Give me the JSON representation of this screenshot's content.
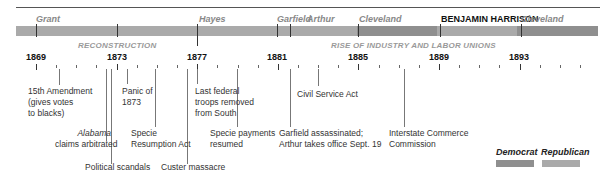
{
  "presidents": [
    {
      "name": "Grant",
      "x": 36,
      "party": "Republican"
    },
    {
      "name": "Hayes",
      "x": 197,
      "party": "Republican"
    },
    {
      "name": "Garfield",
      "x": 277,
      "party": "Republican"
    },
    {
      "name": "Arthur",
      "x": 304,
      "party": "Republican"
    },
    {
      "name": "Cleveland",
      "x": 357,
      "party": "Democrat"
    },
    {
      "name": "BENJAMIN HARRISON",
      "x": 437,
      "party": "Republican"
    },
    {
      "name": "Cleveland",
      "x": 519,
      "party": "Democrat"
    }
  ],
  "eras": [
    {
      "label": "RECONSTRUCTION"
    },
    {
      "label": "RISE OF INDUSTRY AND LABOR UNIONS"
    }
  ],
  "years": [
    "1869",
    "1873",
    "1877",
    "1881",
    "1885",
    "1889",
    "1893"
  ],
  "events": {
    "e1": {
      "line1": "15th Amendment",
      "line2": "(gives votes",
      "line3": "to blacks)"
    },
    "e2": {
      "line1_italic": "Alabama",
      "line2": "claims arbitrated"
    },
    "e3": {
      "line1": "Political scandals"
    },
    "e4": {
      "line1": "Panic of",
      "line2": "1873"
    },
    "e5": {
      "line1": "Specie",
      "line2": "Resumption Act"
    },
    "e6": {
      "line1": "Custer massacre"
    },
    "e7": {
      "line1": "Last federal",
      "line2": "troops removed",
      "line3": "from South"
    },
    "e8": {
      "line1": "Specie payments",
      "line2": "resumed"
    },
    "e9": {
      "line1": "Civil Service Act"
    },
    "e10": {
      "line1": "Garfield assassinated;",
      "line2": "Arthur takes office Sept. 19"
    },
    "e11": {
      "line1": "Interstate Commerce",
      "line2": "Commission"
    }
  },
  "legend": {
    "democrat": {
      "label": "Democrat",
      "color": "#8f8f8f"
    },
    "republican": {
      "label": "Republican",
      "color": "#aaaaaa"
    }
  }
}
